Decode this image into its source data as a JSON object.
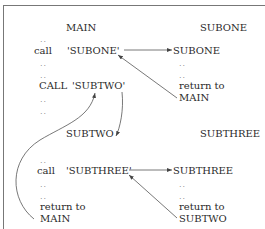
{
  "main": {
    "title": "MAIN",
    "dots": "..",
    "call_lower": "call",
    "call_subone": "'SUBONE'",
    "call_upper": "CALL",
    "call_subtwo": "'SUBTWO'"
  },
  "subone": {
    "title": "SUBONE",
    "entry": "SUBONE",
    "dots": "..",
    "return_line1": "return to",
    "return_line2": "MAIN"
  },
  "subtwo": {
    "title": "SUBTWO",
    "dots": "..",
    "call_lower": "call",
    "call_subthree": "'SUBTHREE'",
    "return_line1": "return to",
    "return_line2": "MAIN"
  },
  "subthree": {
    "title": "SUBTHREE",
    "entry": "SUBTHREE",
    "dots": "..",
    "return_line1": "return to",
    "return_line2": "SUBTWO"
  }
}
